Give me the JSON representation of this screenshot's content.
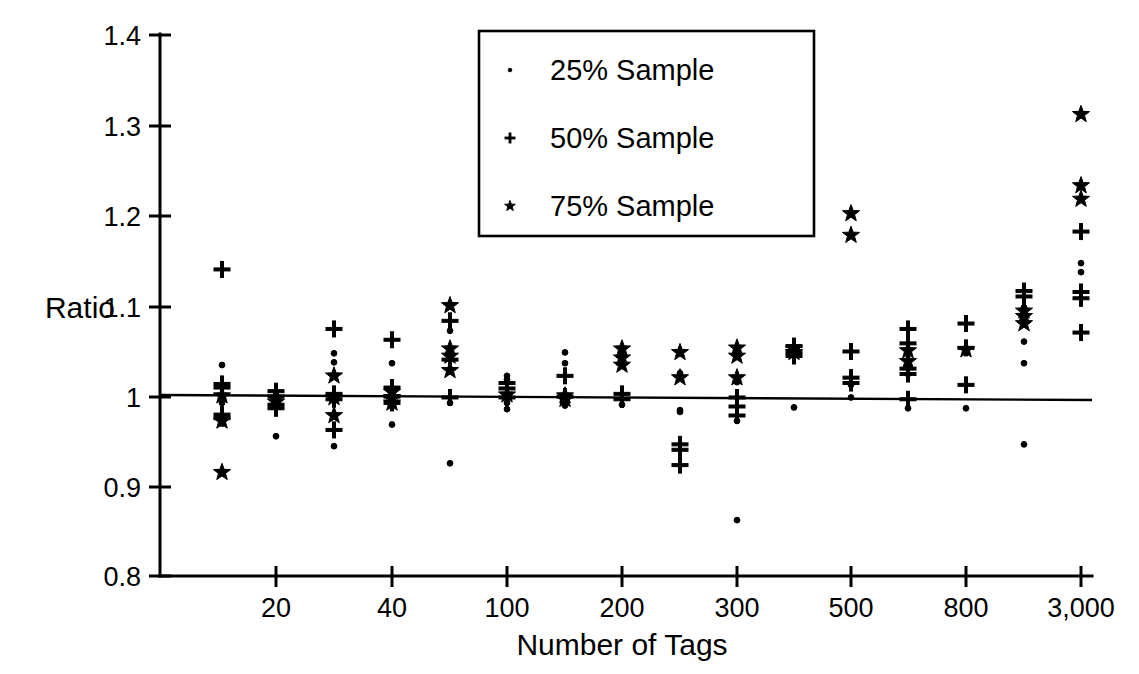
{
  "chart_data": {
    "type": "scatter",
    "title": "",
    "xlabel": "Number of Tags",
    "ylabel": "Ratio",
    "ylim": [
      0.8,
      1.4
    ],
    "yticks": [
      0.8,
      0.9,
      1.0,
      1.1,
      1.2,
      1.3,
      1.4
    ],
    "ytick_labels": [
      "0.8",
      "0.9",
      "1",
      "1.1",
      "1.2",
      "1.3",
      "1.4"
    ],
    "xtick_labels": [
      "20",
      "40",
      "100",
      "200",
      "300",
      "500",
      "800",
      "3,000"
    ],
    "xtick_positions": [
      276,
      392,
      507,
      622,
      737,
      851,
      966,
      1081
    ],
    "grid": false,
    "reference_line": {
      "y": 1.0,
      "label": "Ratio = 1"
    },
    "legend": {
      "position": "top-center-right",
      "entries": [
        {
          "marker": "dot",
          "label": "25% Sample"
        },
        {
          "marker": "plus",
          "label": "50% Sample"
        },
        {
          "marker": "star",
          "label": "75% Sample"
        }
      ]
    },
    "series": [
      {
        "name": "25% Sample",
        "marker": "dot",
        "points": [
          {
            "x": 222,
            "y": 1.034
          },
          {
            "x": 222,
            "y": 0.992
          },
          {
            "x": 276,
            "y": 1.001
          },
          {
            "x": 276,
            "y": 0.998
          },
          {
            "x": 276,
            "y": 0.955
          },
          {
            "x": 334,
            "y": 1.047
          },
          {
            "x": 334,
            "y": 1.037
          },
          {
            "x": 334,
            "y": 0.978
          },
          {
            "x": 334,
            "y": 0.944
          },
          {
            "x": 392,
            "y": 1.036
          },
          {
            "x": 392,
            "y": 0.997
          },
          {
            "x": 392,
            "y": 0.968
          },
          {
            "x": 450,
            "y": 1.072
          },
          {
            "x": 450,
            "y": 0.992
          },
          {
            "x": 450,
            "y": 0.925
          },
          {
            "x": 507,
            "y": 1.022
          },
          {
            "x": 507,
            "y": 1.018
          },
          {
            "x": 507,
            "y": 0.992
          },
          {
            "x": 507,
            "y": 0.985
          },
          {
            "x": 565,
            "y": 1.048
          },
          {
            "x": 565,
            "y": 1.036
          },
          {
            "x": 565,
            "y": 0.989
          },
          {
            "x": 622,
            "y": 1.043
          },
          {
            "x": 622,
            "y": 0.99
          },
          {
            "x": 680,
            "y": 1.025
          },
          {
            "x": 680,
            "y": 0.984
          },
          {
            "x": 680,
            "y": 0.982
          },
          {
            "x": 737,
            "y": 1.015
          },
          {
            "x": 737,
            "y": 0.972
          },
          {
            "x": 737,
            "y": 0.862
          },
          {
            "x": 794,
            "y": 1.05
          },
          {
            "x": 794,
            "y": 0.987
          },
          {
            "x": 851,
            "y": 1.012
          },
          {
            "x": 851,
            "y": 0.998
          },
          {
            "x": 908,
            "y": 1.024
          },
          {
            "x": 908,
            "y": 0.986
          },
          {
            "x": 966,
            "y": 1.052
          },
          {
            "x": 966,
            "y": 0.986
          },
          {
            "x": 1024,
            "y": 1.098
          },
          {
            "x": 1024,
            "y": 1.06
          },
          {
            "x": 1024,
            "y": 1.036
          },
          {
            "x": 1024,
            "y": 0.946
          },
          {
            "x": 1081,
            "y": 1.147
          },
          {
            "x": 1081,
            "y": 1.137
          }
        ]
      },
      {
        "name": "50% Sample",
        "marker": "plus",
        "points": [
          {
            "x": 222,
            "y": 1.14
          },
          {
            "x": 222,
            "y": 1.013
          },
          {
            "x": 222,
            "y": 1.009
          },
          {
            "x": 222,
            "y": 0.979
          },
          {
            "x": 222,
            "y": 0.975
          },
          {
            "x": 276,
            "y": 1.005
          },
          {
            "x": 276,
            "y": 0.999
          },
          {
            "x": 276,
            "y": 0.99
          },
          {
            "x": 276,
            "y": 0.986
          },
          {
            "x": 334,
            "y": 1.074
          },
          {
            "x": 334,
            "y": 1.002
          },
          {
            "x": 334,
            "y": 0.996
          },
          {
            "x": 334,
            "y": 0.962
          },
          {
            "x": 392,
            "y": 1.062
          },
          {
            "x": 392,
            "y": 1.009
          },
          {
            "x": 392,
            "y": 0.999
          },
          {
            "x": 392,
            "y": 0.992
          },
          {
            "x": 450,
            "y": 1.083
          },
          {
            "x": 450,
            "y": 1.04
          },
          {
            "x": 450,
            "y": 0.998
          },
          {
            "x": 507,
            "y": 1.014
          },
          {
            "x": 507,
            "y": 1.008
          },
          {
            "x": 507,
            "y": 0.998
          },
          {
            "x": 565,
            "y": 1.022
          },
          {
            "x": 565,
            "y": 0.999
          },
          {
            "x": 622,
            "y": 1.002
          },
          {
            "x": 622,
            "y": 0.996
          },
          {
            "x": 680,
            "y": 0.946
          },
          {
            "x": 680,
            "y": 0.94
          },
          {
            "x": 680,
            "y": 0.923
          },
          {
            "x": 737,
            "y": 0.998
          },
          {
            "x": 737,
            "y": 0.988
          },
          {
            "x": 737,
            "y": 0.978
          },
          {
            "x": 794,
            "y": 1.055
          },
          {
            "x": 794,
            "y": 1.048
          },
          {
            "x": 794,
            "y": 1.044
          },
          {
            "x": 851,
            "y": 1.049
          },
          {
            "x": 851,
            "y": 1.02
          },
          {
            "x": 851,
            "y": 1.014
          },
          {
            "x": 908,
            "y": 1.074
          },
          {
            "x": 908,
            "y": 1.058
          },
          {
            "x": 908,
            "y": 1.03
          },
          {
            "x": 908,
            "y": 1.024
          },
          {
            "x": 908,
            "y": 0.996
          },
          {
            "x": 966,
            "y": 1.08
          },
          {
            "x": 966,
            "y": 1.053
          },
          {
            "x": 966,
            "y": 1.012
          },
          {
            "x": 1024,
            "y": 1.116
          },
          {
            "x": 1024,
            "y": 1.11
          },
          {
            "x": 1081,
            "y": 1.182
          },
          {
            "x": 1081,
            "y": 1.115
          },
          {
            "x": 1081,
            "y": 1.108
          },
          {
            "x": 1081,
            "y": 1.07
          }
        ]
      },
      {
        "name": "75% Sample",
        "marker": "star",
        "points": [
          {
            "x": 222,
            "y": 1.0
          },
          {
            "x": 222,
            "y": 0.972
          },
          {
            "x": 222,
            "y": 0.915
          },
          {
            "x": 276,
            "y": 0.997
          },
          {
            "x": 276,
            "y": 0.993
          },
          {
            "x": 334,
            "y": 1.022
          },
          {
            "x": 334,
            "y": 0.998
          },
          {
            "x": 334,
            "y": 0.978
          },
          {
            "x": 392,
            "y": 1.004
          },
          {
            "x": 392,
            "y": 0.998
          },
          {
            "x": 392,
            "y": 0.992
          },
          {
            "x": 450,
            "y": 1.1
          },
          {
            "x": 450,
            "y": 1.052
          },
          {
            "x": 450,
            "y": 1.044
          },
          {
            "x": 450,
            "y": 1.028
          },
          {
            "x": 507,
            "y": 1.001
          },
          {
            "x": 565,
            "y": 1.0
          },
          {
            "x": 565,
            "y": 0.996
          },
          {
            "x": 622,
            "y": 1.052
          },
          {
            "x": 622,
            "y": 1.042
          },
          {
            "x": 622,
            "y": 1.034
          },
          {
            "x": 680,
            "y": 1.048
          },
          {
            "x": 680,
            "y": 1.02
          },
          {
            "x": 737,
            "y": 1.053
          },
          {
            "x": 737,
            "y": 1.044
          },
          {
            "x": 737,
            "y": 1.02
          },
          {
            "x": 794,
            "y": 1.052
          },
          {
            "x": 794,
            "y": 1.048
          },
          {
            "x": 851,
            "y": 1.202
          },
          {
            "x": 851,
            "y": 1.178
          },
          {
            "x": 908,
            "y": 1.05
          },
          {
            "x": 908,
            "y": 1.038
          },
          {
            "x": 966,
            "y": 1.051
          },
          {
            "x": 1024,
            "y": 1.094
          },
          {
            "x": 1024,
            "y": 1.088
          },
          {
            "x": 1024,
            "y": 1.08
          },
          {
            "x": 1081,
            "y": 1.312
          },
          {
            "x": 1081,
            "y": 1.233
          },
          {
            "x": 1081,
            "y": 1.218
          }
        ]
      }
    ]
  },
  "axes": {
    "y_label": "Ratio",
    "x_label": "Number of Tags",
    "y_tick_labels": [
      "1.4",
      "1.3",
      "1.2",
      "1.1",
      "1",
      "0.9",
      "0.8"
    ],
    "x_tick_labels": [
      "20",
      "40",
      "100",
      "200",
      "300",
      "500",
      "800",
      "3,000"
    ]
  },
  "legend": {
    "items": [
      {
        "label": "25% Sample",
        "marker": "dot"
      },
      {
        "label": "50% Sample",
        "marker": "plus"
      },
      {
        "label": "75% Sample",
        "marker": "star"
      }
    ]
  },
  "colors": {
    "ink": "#000000",
    "background": "#ffffff"
  }
}
